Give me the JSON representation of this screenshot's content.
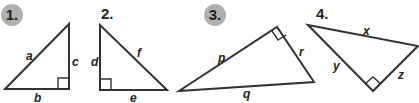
{
  "problems": [
    {
      "number": "1.",
      "highlighted": true,
      "sides": [
        "a",
        "b",
        "c"
      ]
    },
    {
      "number": "2.",
      "highlighted": false,
      "sides": [
        "d",
        "e",
        "f"
      ]
    },
    {
      "number": "3.",
      "highlighted": true,
      "sides": [
        "p",
        "q",
        "r"
      ]
    },
    {
      "number": "4.",
      "highlighted": false,
      "sides": [
        "x",
        "y",
        "z"
      ]
    }
  ],
  "colors": {
    "stroke": "#333333",
    "badge": "#b0b0b0"
  }
}
